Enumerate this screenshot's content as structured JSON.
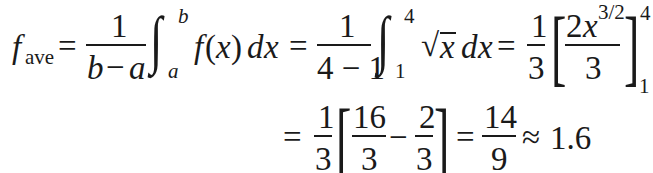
{
  "equation": {
    "line1": {
      "lhs": {
        "f": "f",
        "sub": "ave"
      },
      "eq1": "=",
      "frac1": {
        "num": "1",
        "den_b": "b",
        "den_minus": "−",
        "den_a": "a"
      },
      "int1": {
        "sign": "∫",
        "upper": "b",
        "lower": "a"
      },
      "integrand1": {
        "f": "f",
        "open": "(",
        "x": "x",
        "close": ")",
        "d": "d",
        "dx_x": "x"
      },
      "eq2": "=",
      "frac2": {
        "num": "1",
        "den": "4 − 1"
      },
      "int2": {
        "sign": "∫",
        "upper": "4",
        "lower": "1"
      },
      "integrand2": {
        "sqrt": "√",
        "x": "x",
        "d": "d",
        "dx_x": "x"
      },
      "eq3": "=",
      "frac3": {
        "num": "1",
        "den": "3"
      },
      "bracket_eval": {
        "open": "[",
        "num_coef": "2",
        "num_var": "x",
        "num_exp": "3/2",
        "den": "3",
        "close": "]",
        "upper": "4",
        "lower": "1"
      }
    },
    "line2": {
      "eq1": "=",
      "frac1": {
        "num": "1",
        "den": "3"
      },
      "open": "[",
      "fracA": {
        "num": "16",
        "den": "3"
      },
      "minus": "−",
      "fracB": {
        "num": "2",
        "den": "3"
      },
      "close": "]",
      "eq2": "=",
      "frac2": {
        "num": "14",
        "den": "9"
      },
      "approx": "≈",
      "result": "1.6"
    }
  }
}
